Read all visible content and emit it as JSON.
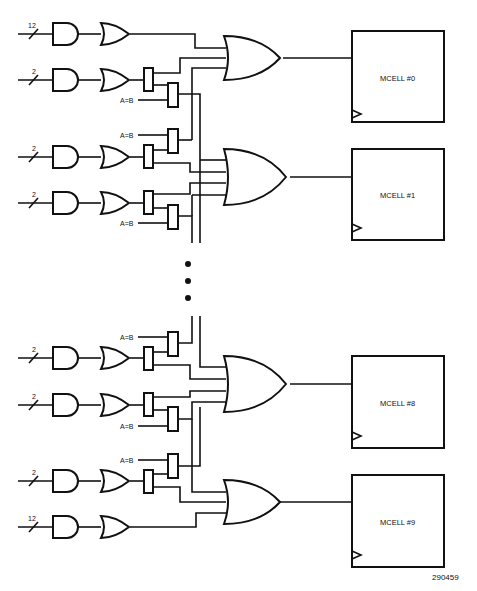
{
  "diagram": {
    "figure_number": "290459",
    "input_buses": [
      {
        "width_label": "12"
      },
      {
        "width_label": "2"
      },
      {
        "width_label": "2"
      },
      {
        "width_label": "2"
      },
      {
        "width_label": "2"
      },
      {
        "width_label": "2"
      },
      {
        "width_label": "2"
      },
      {
        "width_label": "12"
      }
    ],
    "select_labels": [
      "A=B",
      "A=B",
      "A=B",
      "A=B",
      "A=B",
      "A=B"
    ],
    "macrocells": [
      {
        "label": "MCELL #0"
      },
      {
        "label": "MCELL #1"
      },
      {
        "label": "MCELL #8"
      },
      {
        "label": "MCELL #9"
      }
    ],
    "ellipsis": "⋮"
  }
}
